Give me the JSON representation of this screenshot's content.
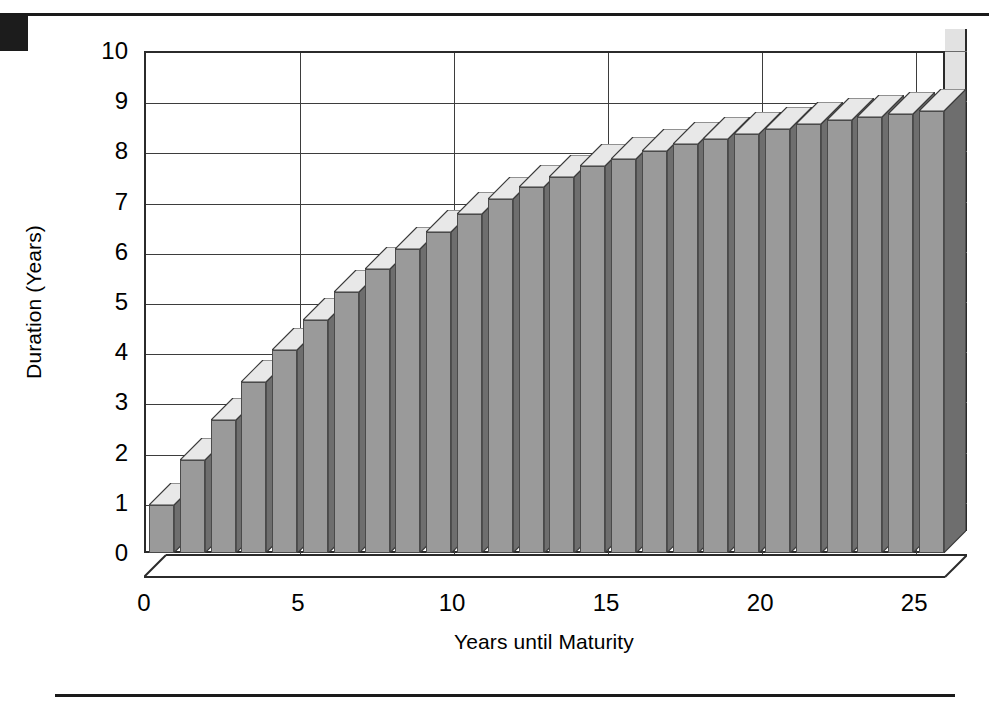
{
  "page": {
    "background_color": "#ffffff",
    "rule_color": "#1a1a1a",
    "corner_marker_color": "#1c1c1c"
  },
  "chart_data": {
    "type": "bar",
    "title": "",
    "subtitle": "",
    "xlabel": "Years until Maturity",
    "ylabel": "Duration (Years)",
    "xlim": [
      0,
      26
    ],
    "ylim": [
      0,
      10
    ],
    "y_ticks": [
      0,
      1,
      2,
      3,
      4,
      5,
      6,
      7,
      8,
      9,
      10
    ],
    "y_tick_labels": [
      "0",
      "1",
      "2",
      "3",
      "4",
      "5",
      "6",
      "7",
      "8",
      "9",
      "10"
    ],
    "x_ticks": [
      0,
      5,
      10,
      15,
      20,
      25
    ],
    "x_tick_labels": [
      "0",
      "5",
      "10",
      "15",
      "20",
      "25"
    ],
    "grid": true,
    "grid_orientation": "both",
    "legend": false,
    "legend_position": "none",
    "style": "3d-column",
    "bar_count": 26,
    "colors": {
      "bar_front": "#9a9a9a",
      "bar_side": "#6e6e6e",
      "bar_top": "#e8e8e8",
      "bar_back_shadow": "#dcdcdc",
      "plot_background": "#ffffff",
      "side_wall": "#e2e2e2",
      "grid": "#3d3d3d",
      "axis": "#2b2b2b",
      "text": "#000000"
    },
    "categories": [
      1,
      2,
      3,
      4,
      5,
      6,
      7,
      8,
      9,
      10,
      11,
      12,
      13,
      14,
      15,
      16,
      17,
      18,
      19,
      20,
      21,
      22,
      23,
      24,
      25,
      26
    ],
    "values": [
      0.95,
      1.85,
      2.65,
      3.4,
      4.05,
      4.65,
      5.2,
      5.65,
      6.05,
      6.4,
      6.75,
      7.05,
      7.3,
      7.5,
      7.7,
      7.85,
      8.0,
      8.15,
      8.25,
      8.35,
      8.45,
      8.55,
      8.62,
      8.68,
      8.74,
      8.8
    ]
  },
  "axes": {
    "y_title": "Duration (Years)",
    "x_title": "Years until Maturity"
  },
  "icons": {
    "corner_marker": "solid-block-marker"
  }
}
